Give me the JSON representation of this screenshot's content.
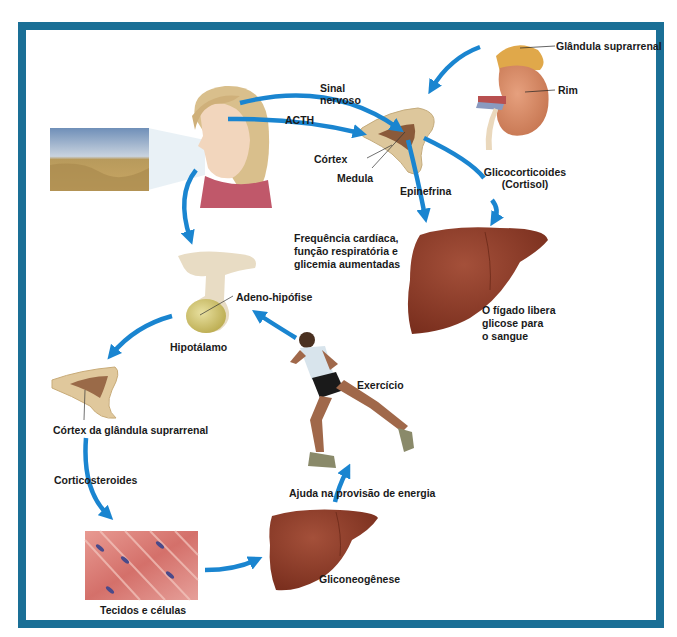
{
  "diagram": {
    "frame_color": "#1a6f96",
    "arrow_color": "#1a85d0",
    "labels": {
      "adrenal_gland": "Glândula suprarrenal",
      "kidney": "Rim",
      "nerve_signal_1": "Sinal",
      "nerve_signal_2": "nervoso",
      "acth": "ACTH",
      "cortex": "Córtex",
      "medulla": "Medula",
      "epinephrine": "Epinefrina",
      "glucocorticoids_1": "Glicocorticoides",
      "glucocorticoids_2": "(Cortisol)",
      "effects_1": "Frequência cardíaca,",
      "effects_2": "função respiratória e",
      "effects_3": "glicemia aumentadas",
      "liver_release_1": "O fígado libera",
      "liver_release_2": "glicose para",
      "liver_release_3": "o sangue",
      "adenohypophysis": "Adeno-hipófise",
      "hypothalamus": "Hipotálamo",
      "exercise": "Exercício",
      "adrenal_cortex": "Córtex da glândula suprarrenal",
      "corticosteroids": "Corticosteroides",
      "energy": "Ajuda na provisão de energia",
      "tissues": "Tecidos e células",
      "gluconeogenesis": "Gliconeogênese"
    },
    "illustrations": [
      "landscape-photo",
      "woman-head",
      "adrenal-gland-cross-section",
      "kidney-with-adrenal",
      "liver-upper",
      "pituitary-hypothalamus",
      "runner",
      "adrenal-cortex-cross-section",
      "muscle-tissue",
      "liver-lower"
    ]
  }
}
